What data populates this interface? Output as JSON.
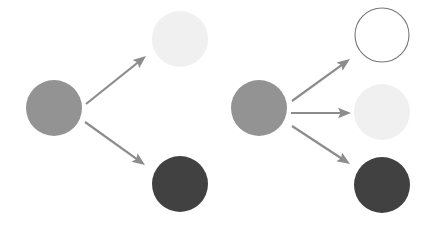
{
  "canvas": {
    "width": 439,
    "height": 227,
    "background": "#ffffff"
  },
  "palette": {
    "source_gray": "#939393",
    "light_pale": "#f0f0f0",
    "dark_gray": "#414141",
    "outline_white_fill": "#ffffff",
    "outline_white_stroke": "#757575",
    "arrow": "#8c8c8c"
  },
  "diagram": {
    "type": "node-arrow-diagram",
    "groups": [
      {
        "id": "group-left",
        "name": "left-group",
        "source": {
          "id": "left-source-circle",
          "name": "source-circle-gray",
          "cx": 54,
          "cy": 108,
          "r": 28,
          "fill": "#939393",
          "stroke": "none",
          "outlined": false
        },
        "targets": [
          {
            "id": "left-target-light",
            "name": "target-circle-light",
            "cx": 180,
            "cy": 39,
            "r": 28,
            "fill": "#f0f0f0",
            "stroke": "none",
            "outlined": false
          },
          {
            "id": "left-target-dark",
            "name": "target-circle-dark",
            "cx": 180,
            "cy": 184,
            "r": 28,
            "fill": "#414141",
            "stroke": "none",
            "outlined": false
          }
        ],
        "arrows": [
          {
            "id": "left-arrow-up",
            "name": "arrow-to-light",
            "x1": 86,
            "y1": 104,
            "x2": 146,
            "y2": 56,
            "direction": "up-right",
            "color": "#8c8c8c"
          },
          {
            "id": "left-arrow-down",
            "name": "arrow-to-dark",
            "x1": 85,
            "y1": 122,
            "x2": 145,
            "y2": 165,
            "direction": "down-right",
            "color": "#8c8c8c"
          }
        ]
      },
      {
        "id": "group-right",
        "name": "right-group",
        "source": {
          "id": "right-source-circle",
          "name": "source-circle-gray",
          "cx": 259,
          "cy": 108,
          "r": 28,
          "fill": "#939393",
          "stroke": "none",
          "outlined": false
        },
        "targets": [
          {
            "id": "right-target-outline",
            "name": "target-circle-outline",
            "cx": 382,
            "cy": 35,
            "r": 27,
            "fill": "#ffffff",
            "stroke": "#757575",
            "outlined": true
          },
          {
            "id": "right-target-light",
            "name": "target-circle-light",
            "cx": 382,
            "cy": 112,
            "r": 28,
            "fill": "#f0f0f0",
            "stroke": "none",
            "outlined": false
          },
          {
            "id": "right-target-dark",
            "name": "target-circle-dark",
            "cx": 382,
            "cy": 185,
            "r": 28,
            "fill": "#414141",
            "stroke": "none",
            "outlined": false
          }
        ],
        "arrows": [
          {
            "id": "right-arrow-up",
            "name": "arrow-to-outline",
            "x1": 292,
            "y1": 101,
            "x2": 350,
            "y2": 59,
            "direction": "up-right",
            "color": "#8c8c8c"
          },
          {
            "id": "right-arrow-mid",
            "name": "arrow-to-light",
            "x1": 291,
            "y1": 113,
            "x2": 351,
            "y2": 113,
            "direction": "right",
            "color": "#8c8c8c"
          },
          {
            "id": "right-arrow-down",
            "name": "arrow-to-dark",
            "x1": 292,
            "y1": 126,
            "x2": 350,
            "y2": 164,
            "direction": "down-right",
            "color": "#8c8c8c"
          }
        ]
      }
    ]
  }
}
